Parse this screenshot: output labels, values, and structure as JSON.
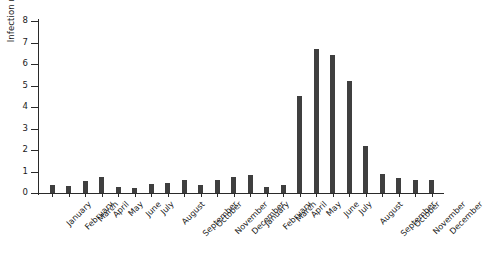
{
  "chart_data": {
    "type": "bar",
    "title": "",
    "subtitle": "",
    "xlabel": "",
    "ylabel": "Infection rate",
    "ylim": [
      0,
      8
    ],
    "ytick_labels": [
      "0",
      "1",
      "2",
      "3",
      "4",
      "5",
      "6",
      "7",
      "8"
    ],
    "ytick_values": [
      0,
      1,
      2,
      3,
      4,
      5,
      6,
      7,
      8
    ],
    "grid": false,
    "legend": false,
    "legend_position": "none",
    "bar_color": "#3f3f3f",
    "axis_color": "#2a2a2a",
    "background_color": "#ffffff",
    "categories": [
      "January",
      "February",
      "March",
      "April",
      "May",
      "June",
      "July",
      "August",
      "September",
      "October",
      "November",
      "December",
      "January",
      "February",
      "March",
      "April",
      "May",
      "June",
      "July",
      "August",
      "September",
      "October",
      "November",
      "December"
    ],
    "values": [
      0.35,
      0.32,
      0.55,
      0.75,
      0.3,
      0.25,
      0.4,
      0.45,
      0.6,
      0.35,
      0.6,
      0.75,
      0.85,
      0.3,
      0.35,
      4.5,
      6.7,
      6.4,
      5.2,
      2.2,
      0.9,
      0.7,
      0.6,
      0.6
    ]
  }
}
